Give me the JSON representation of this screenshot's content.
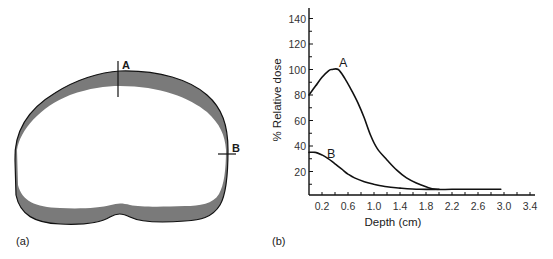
{
  "panel_a": {
    "label": "(a)",
    "markers": [
      {
        "id": "A",
        "label": "A",
        "orientation": "vertical"
      },
      {
        "id": "B",
        "label": "B",
        "orientation": "horizontal"
      }
    ],
    "colors": {
      "band": "#7a7a7a",
      "outline": "#111111"
    }
  },
  "panel_b": {
    "label": "(b)"
  },
  "chart_data": {
    "type": "line",
    "title": "",
    "xlabel": "Depth (cm)",
    "ylabel": "% Relative dose",
    "xlim": [
      0,
      3.4
    ],
    "ylim": [
      0,
      150
    ],
    "x_ticks": [
      0.2,
      0.6,
      1.0,
      1.4,
      1.8,
      2.2,
      2.6,
      3.0,
      3.4
    ],
    "x_tick_labels": [
      "0.2",
      "0.6",
      "1.0",
      "1.4",
      "1.8",
      "2.2",
      "2.6",
      "3.0",
      "3.4"
    ],
    "x_minor_step": 0.2,
    "y_ticks": [
      20,
      40,
      60,
      80,
      100,
      120,
      140
    ],
    "y_tick_labels": [
      "20",
      "40",
      "60",
      "80",
      "100",
      "120",
      "140"
    ],
    "y_minor_step": 10,
    "grid": false,
    "legend": "none",
    "series": [
      {
        "name": "A",
        "label": "A",
        "x": [
          0.0,
          0.1,
          0.2,
          0.3,
          0.35,
          0.45,
          0.55,
          0.65,
          0.75,
          0.85,
          0.95,
          1.05,
          1.2,
          1.35,
          1.5,
          1.65,
          1.8,
          1.95,
          2.2,
          2.6,
          2.95
        ],
        "y": [
          80,
          87,
          94,
          99,
          100,
          100,
          93,
          84,
          74,
          62,
          48,
          38,
          29,
          21,
          15,
          11,
          8,
          6,
          6,
          6,
          6
        ]
      },
      {
        "name": "B",
        "label": "B",
        "x": [
          0.0,
          0.1,
          0.2,
          0.3,
          0.4,
          0.5,
          0.6,
          0.7,
          0.85,
          1.0,
          1.2,
          1.4,
          1.7,
          2.0
        ],
        "y": [
          35,
          35,
          33,
          30,
          26,
          22,
          18,
          15,
          12,
          10,
          8,
          7,
          6,
          6
        ]
      }
    ]
  }
}
